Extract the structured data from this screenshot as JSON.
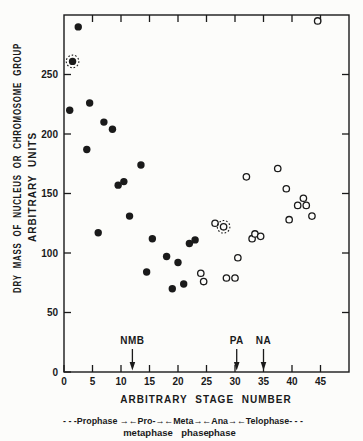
{
  "figure": {
    "background": "#fcfcfa",
    "ink": "#1a1a1a"
  },
  "chart_data": {
    "type": "scatter",
    "title": "",
    "xlabel": "ARBITRARY STAGE NUMBER",
    "ylabel_line1": "DRY MASS OF NUCLEUS OR CHROMOSOME GROUP",
    "ylabel_line2": "ARBITRARY UNITS",
    "xlim": [
      0,
      50
    ],
    "ylim": [
      0,
      300
    ],
    "xticks": [
      0,
      5,
      10,
      15,
      20,
      25,
      30,
      35,
      40,
      45
    ],
    "yticks": [
      0,
      50,
      100,
      150,
      200,
      250
    ],
    "grid": false,
    "frame": "full-box",
    "legend": "none",
    "series": [
      {
        "name": "filled-circles",
        "marker": "filled",
        "points": [
          [
            1,
            220
          ],
          [
            1.5,
            261
          ],
          [
            2.5,
            290
          ],
          [
            4,
            187
          ],
          [
            4.5,
            226
          ],
          [
            6,
            117
          ],
          [
            7,
            210
          ],
          [
            8.5,
            204
          ],
          [
            9.5,
            157
          ],
          [
            10.5,
            160
          ],
          [
            11.5,
            131
          ],
          [
            13.5,
            174
          ],
          [
            14.5,
            84
          ],
          [
            15.5,
            112
          ],
          [
            18,
            97
          ],
          [
            19,
            70
          ],
          [
            20,
            92
          ],
          [
            21,
            74
          ],
          [
            22,
            108
          ],
          [
            23,
            111
          ]
        ]
      },
      {
        "name": "open-circles",
        "marker": "open",
        "points": [
          [
            24,
            83
          ],
          [
            24.5,
            76
          ],
          [
            26.5,
            125
          ],
          [
            28,
            122
          ],
          [
            28.5,
            79
          ],
          [
            30,
            79
          ],
          [
            30.5,
            96
          ],
          [
            32,
            164
          ],
          [
            33,
            112
          ],
          [
            33.5,
            116
          ],
          [
            34.5,
            114
          ],
          [
            37.5,
            171
          ],
          [
            39,
            154
          ],
          [
            39.5,
            128
          ],
          [
            41,
            140
          ],
          [
            42,
            146
          ],
          [
            42.5,
            140
          ],
          [
            43.5,
            131
          ],
          [
            44.5,
            295
          ]
        ]
      },
      {
        "name": "ringed-highlights",
        "marker": "dotted-ring",
        "points": [
          [
            1.5,
            261
          ],
          [
            28,
            122
          ]
        ]
      }
    ],
    "annotations": [
      {
        "label": "NMB",
        "x": 12
      },
      {
        "label": "PA",
        "x": 30.3
      },
      {
        "label": "NA",
        "x": 35
      }
    ],
    "phase_scale": {
      "line1": "- - -Prophase →←Pro-→←Meta→←Ana→←Telophase- - -",
      "line2_words": [
        {
          "text": "metaphase",
          "x": 148
        },
        {
          "text": "phase",
          "x": 195
        },
        {
          "text": "phase",
          "x": 222
        }
      ]
    }
  }
}
